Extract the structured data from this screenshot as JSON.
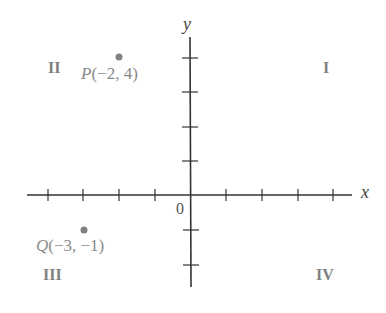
{
  "diagram": {
    "title": "",
    "axes": {
      "x_label": "x",
      "y_label": "y",
      "origin_label": "0",
      "x_ticks_negative": 4,
      "x_ticks_positive": 4,
      "y_ticks_positive": 4,
      "y_ticks_negative": 2,
      "axis_color": "#333333"
    },
    "quadrants": [
      {
        "id": "I",
        "label": "I"
      },
      {
        "id": "II",
        "label": "II"
      },
      {
        "id": "III",
        "label": "III"
      },
      {
        "id": "IV",
        "label": "IV"
      }
    ],
    "points": [
      {
        "name": "P",
        "coords_text": "(−2, 4)",
        "x": -2,
        "y": 4,
        "color": "#808080"
      },
      {
        "name": "Q",
        "coords_text": "(−3, −1)",
        "x": -3,
        "y": -1,
        "color": "#808080"
      }
    ]
  }
}
